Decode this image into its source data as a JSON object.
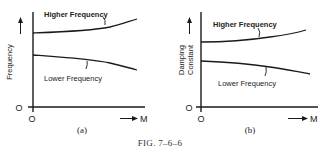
{
  "figure": {
    "caption": "FIG. 7–6–6"
  },
  "panels": [
    {
      "id": "a",
      "sublabel": "(a)",
      "ylabel": "Frequency",
      "xlabel": "M",
      "origin_x": "O",
      "origin_y": "O",
      "curves": [
        {
          "name": "Higher Frequency",
          "label": "Higher Frequency",
          "trend": "increasing"
        },
        {
          "name": "Lower Frequency",
          "label": "Lower Frequency",
          "trend": "decreasing"
        }
      ]
    },
    {
      "id": "b",
      "sublabel": "(b)",
      "ylabel_line1": "Damping",
      "ylabel_line2": "Constant",
      "xlabel": "M",
      "origin_x": "O",
      "origin_y": "O",
      "curves": [
        {
          "name": "Higher Frequency",
          "label": "Higher Frequency",
          "trend": "increasing"
        },
        {
          "name": "Lower Frequency",
          "label": "Lower Frequency",
          "trend": "decreasing"
        }
      ]
    }
  ],
  "colors": {
    "ink": "#1a1a1a",
    "background": "#ffffff"
  }
}
